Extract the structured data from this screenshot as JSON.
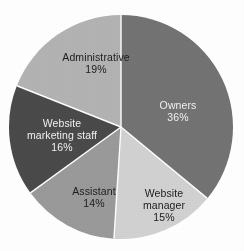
{
  "chart_data": {
    "type": "pie",
    "title": "",
    "subtitle": "",
    "xlabel": "",
    "ylabel": "",
    "legend": "none",
    "grid": false,
    "labels_inside_slices": true,
    "start_angle_deg": 0,
    "direction": "clockwise",
    "categories": [
      "Owners",
      "Website manager",
      "Assistant",
      "Website marketing staff",
      "Administrative"
    ],
    "values": [
      36,
      15,
      14,
      16,
      19
    ],
    "value_unit": "%",
    "slices": [
      {
        "name": "Owners",
        "label_lines": [
          "Owners"
        ],
        "percent_text": "36%",
        "value": 36,
        "color": "#737373",
        "text_color": "#f2f2f2",
        "start_deg": 0,
        "end_deg": 129.6
      },
      {
        "name": "Website manager",
        "label_lines": [
          "Website",
          "manager"
        ],
        "percent_text": "15%",
        "value": 15,
        "color": "#d2d2d2",
        "text_color": "#1c1c1c",
        "start_deg": 129.6,
        "end_deg": 183.6
      },
      {
        "name": "Assistant",
        "label_lines": [
          "Assistant"
        ],
        "percent_text": "14%",
        "value": 14,
        "color": "#9a9a9a",
        "text_color": "#1c1c1c",
        "start_deg": 183.6,
        "end_deg": 234.0
      },
      {
        "name": "Website marketing staff",
        "label_lines": [
          "Website",
          "marketing staff"
        ],
        "percent_text": "16%",
        "value": 16,
        "color": "#4a4a4a",
        "text_color": "#f2f2f2",
        "start_deg": 234.0,
        "end_deg": 291.6
      },
      {
        "name": "Administrative",
        "label_lines": [
          "Administrative"
        ],
        "percent_text": "19%",
        "value": 19,
        "color": "#b3b3b3",
        "text_color": "#1c1c1c",
        "start_deg": 291.6,
        "end_deg": 360.0
      }
    ],
    "geometry": {
      "center_x": 121,
      "center_y": 127,
      "radius": 112,
      "separator_color": "#ffffff",
      "separator_width": 1.4,
      "background": "#ffffff"
    }
  },
  "labels": {
    "owners": {
      "name": "Owners",
      "percent": "36%"
    },
    "website_manager": {
      "line1": "Website",
      "line2": "manager",
      "percent": "15%"
    },
    "assistant": {
      "name": "Assistant",
      "percent": "14%"
    },
    "website_marketing_staff": {
      "line1": "Website",
      "line2": "marketing staff",
      "percent": "16%"
    },
    "administrative": {
      "name": "Administrative",
      "percent": "19%"
    }
  }
}
